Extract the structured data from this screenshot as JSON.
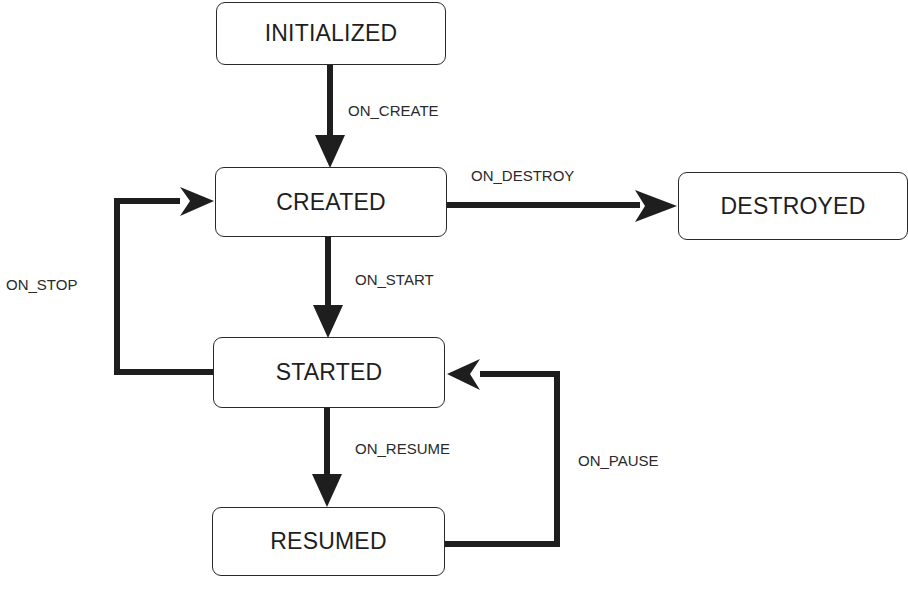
{
  "diagram": {
    "type": "state-machine",
    "states": [
      {
        "id": "initialized",
        "label": "INITIALIZED"
      },
      {
        "id": "created",
        "label": "CREATED"
      },
      {
        "id": "destroyed",
        "label": "DESTROYED"
      },
      {
        "id": "started",
        "label": "STARTED"
      },
      {
        "id": "resumed",
        "label": "RESUMED"
      }
    ],
    "transitions": [
      {
        "from": "initialized",
        "to": "created",
        "label": "ON_CREATE"
      },
      {
        "from": "created",
        "to": "destroyed",
        "label": "ON_DESTROY"
      },
      {
        "from": "created",
        "to": "started",
        "label": "ON_START"
      },
      {
        "from": "started",
        "to": "created",
        "label": "ON_STOP"
      },
      {
        "from": "started",
        "to": "resumed",
        "label": "ON_RESUME"
      },
      {
        "from": "resumed",
        "to": "started",
        "label": "ON_PAUSE"
      }
    ],
    "colors": {
      "line": "#1e1e1e",
      "box_border": "#2a2a2a",
      "background": "#ffffff"
    }
  }
}
